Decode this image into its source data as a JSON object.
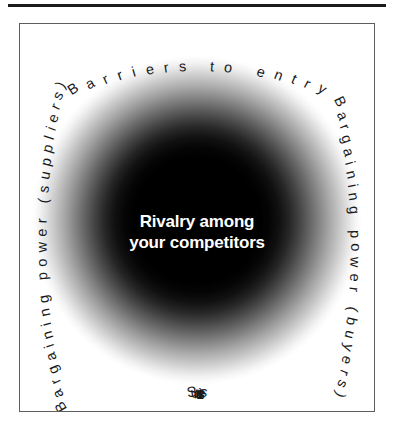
{
  "diagram": {
    "kind": "five-forces-radial",
    "top_rule": true,
    "frame": {
      "border_color": "#5d5d5d",
      "background": "#ffffff"
    },
    "center": {
      "line1": "Rivalry among",
      "line2": "your competitors",
      "text": "Rivalry among\nyour competitors",
      "text_color": "#ffffff",
      "blob_color": "#000000"
    },
    "forces": {
      "top": {
        "label": "Barriers to entry",
        "position": "top",
        "curve": "arched-up"
      },
      "bottom": {
        "label": "Substitutes",
        "position": "bottom",
        "curve": "arched-down"
      },
      "left": {
        "label": "Bargaining power (suppliers)",
        "position": "left",
        "curve": "arched",
        "rotation": "-90"
      },
      "right": {
        "label": "Bargaining power (buyers)",
        "position": "right",
        "curve": "arched",
        "rotation": "90"
      }
    }
  }
}
